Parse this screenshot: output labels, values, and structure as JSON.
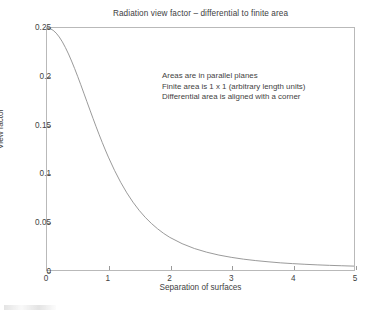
{
  "chart_data": {
    "type": "line",
    "title": "Radiation view factor – differential to finite area",
    "xlabel": "Separation of surfaces",
    "ylabel": "View factor",
    "xlim": [
      0,
      5
    ],
    "ylim": [
      0,
      0.25
    ],
    "xticks": [
      0,
      1,
      2,
      3,
      4,
      5
    ],
    "xtick_labels": [
      "0",
      "1",
      "2",
      "3",
      "4",
      "5"
    ],
    "yticks": [
      0,
      0.05,
      0.1,
      0.15,
      0.2,
      0.25
    ],
    "ytick_labels": [
      "0",
      "0.05",
      "0.1",
      "0.15",
      "0.2",
      "0.25"
    ],
    "grid": false,
    "legend": null,
    "line_color": "#8d8d8d",
    "annotations": [
      "Areas are in parallel planes",
      "Finite area is 1 x 1 (arbitrary length units)",
      "Differential area is aligned with a corner"
    ],
    "series": [
      {
        "name": "View factor",
        "x": [
          0.0,
          0.05,
          0.1,
          0.15,
          0.2,
          0.25,
          0.3,
          0.35,
          0.4,
          0.45,
          0.5,
          0.55,
          0.6,
          0.65,
          0.7,
          0.75,
          0.8,
          0.85,
          0.9,
          0.95,
          1.0,
          1.1,
          1.2,
          1.3,
          1.4,
          1.5,
          1.6,
          1.7,
          1.8,
          1.9,
          2.0,
          2.2,
          2.4,
          2.6,
          2.8,
          3.0,
          3.2,
          3.4,
          3.6,
          3.8,
          4.0,
          4.2,
          4.4,
          4.6,
          4.8,
          5.0
        ],
        "y": [
          0.25,
          0.2494,
          0.2476,
          0.2447,
          0.2407,
          0.2357,
          0.2298,
          0.2232,
          0.2159,
          0.2081,
          0.1999,
          0.1914,
          0.1827,
          0.1739,
          0.1652,
          0.1565,
          0.148,
          0.1397,
          0.1317,
          0.124,
          0.1166,
          0.1029,
          0.0906,
          0.0797,
          0.0701,
          0.0617,
          0.0544,
          0.0481,
          0.0426,
          0.0378,
          0.0337,
          0.0272,
          0.0222,
          0.0184,
          0.0154,
          0.0131,
          0.0112,
          0.0097,
          0.0085,
          0.0074,
          0.0066,
          0.0059,
          0.0053,
          0.0048,
          0.0044,
          0.004
        ]
      }
    ]
  }
}
